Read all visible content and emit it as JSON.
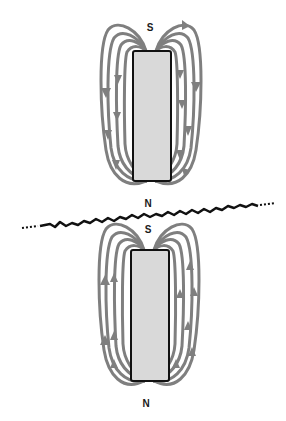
{
  "diagram": {
    "colors": {
      "background": "#ffffff",
      "field_line": "#7f7f7f",
      "magnet_fill": "#d9d9d9",
      "magnet_outline": "#111111",
      "break_line": "#111111",
      "label": "#1a1a1a"
    },
    "top_magnet": {
      "top_label": "S",
      "bottom_label": "N",
      "field_direction": "down",
      "bounds": {
        "x": 133,
        "y": 51,
        "width": 38,
        "height": 130
      }
    },
    "bottom_magnet": {
      "top_label": "S",
      "bottom_label": "N",
      "field_direction": "up",
      "bounds": {
        "x": 131,
        "y": 250,
        "width": 38,
        "height": 131
      }
    },
    "break_line": {
      "description": "jagged break line separating the two magnets",
      "from": [
        22,
        228
      ],
      "to": [
        275,
        203
      ]
    }
  }
}
